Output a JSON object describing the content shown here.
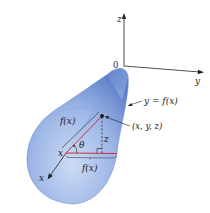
{
  "diagram": {
    "type": "surface-of-revolution",
    "colors": {
      "surface_light": "#c9d8f2",
      "surface_mid": "#8aa6e0",
      "surface_dark": "#4f72c4",
      "triangle_red": "#c8323c",
      "axis": "#222222"
    },
    "axes": {
      "origin_label": "0",
      "z_label": "z",
      "y_label": "y",
      "x_label": "x"
    },
    "labels": {
      "curve": "y = f(x)",
      "point": "(x, y, z)",
      "radius_slant": "f(x)",
      "radius_horizontal": "f(x)",
      "angle": "θ",
      "height": "z",
      "x_position": "x"
    }
  }
}
